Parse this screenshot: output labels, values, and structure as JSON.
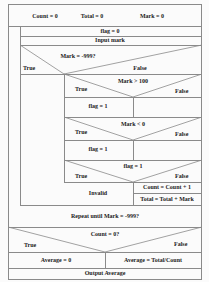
{
  "diagram": {
    "type": "nassi-shneiderman",
    "init": {
      "count": "Count = 0",
      "total": "Total = 0",
      "mark": "Mark = 0"
    },
    "loop": {
      "set_flag": "flag = 0",
      "input": "Input mark",
      "decision1": {
        "condition": "Mark = -999?",
        "true_label": "True",
        "false_label": "False"
      },
      "decision2": {
        "condition": "Mark > 100",
        "true_label": "True",
        "false_label": "False",
        "true_action": "flag = 1"
      },
      "decision3": {
        "condition": "Mark < 0",
        "true_label": "True",
        "false_label": "False",
        "true_action": "flag = 1"
      },
      "decision4": {
        "condition": "flag = 1",
        "true_label": "True",
        "false_label": "False",
        "true_action": "Invalid",
        "false_action_1": "Count = Count + 1",
        "false_action_2": "Total = Total + Mark"
      },
      "until": "Repeat until Mark = -999?"
    },
    "final_decision": {
      "condition": "Count = 0?",
      "true_label": "True",
      "false_label": "False",
      "true_action": "Average = 0",
      "false_action": "Average = Total/Count"
    },
    "output": "Output Average"
  }
}
